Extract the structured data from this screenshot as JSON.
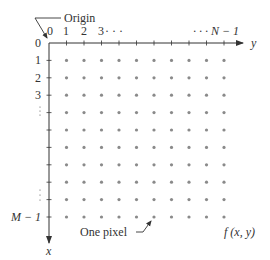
{
  "diagram": {
    "title_label": "Origin",
    "col_labels": [
      "0",
      "1",
      "2",
      "3",
      "· · ·",
      "· · · N − 1"
    ],
    "row_labels": [
      "0",
      "1",
      "2",
      "3",
      "M − 1"
    ],
    "axis_y_label": "y",
    "axis_x_label": "x",
    "pixel_label": "One pixel",
    "function_label": "f (x, y)",
    "grid": {
      "cols": 11,
      "rows": 11,
      "origin": [
        49,
        43
      ],
      "spacing_x": 17.5,
      "spacing_y": 17.4
    },
    "colors": {
      "axis": "#333333",
      "dot": "#8a8a8a",
      "text": "#333333"
    }
  }
}
